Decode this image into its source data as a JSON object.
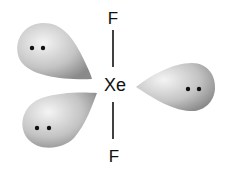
{
  "diagram": {
    "central_atom": "Xe",
    "bonded_atoms": [
      {
        "label": "F",
        "position": "top"
      },
      {
        "label": "F",
        "position": "bottom"
      }
    ],
    "lone_pairs": [
      {
        "position": "upper-left",
        "electrons": 2
      },
      {
        "position": "lower-left",
        "electrons": 2
      },
      {
        "position": "right",
        "electrons": 2
      }
    ],
    "colors": {
      "lobe_light": "#f2f2f2",
      "lobe_dark": "#8a8a8a",
      "text": "#111111"
    }
  }
}
